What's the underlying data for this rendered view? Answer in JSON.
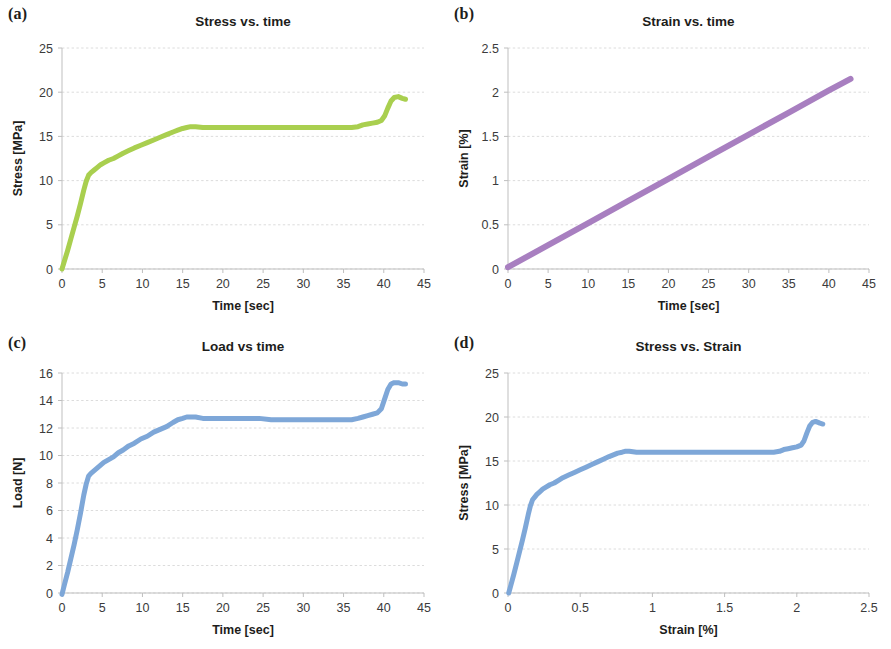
{
  "figure": {
    "background": "#ffffff",
    "panel_labels": [
      "(a)",
      "(b)",
      "(c)",
      "(d)"
    ]
  },
  "colors": {
    "green": "#a9cf4f",
    "purple": "#a87fc0",
    "blue": "#7ea7d8",
    "gridline": "#d8d8d8",
    "axis": "#bfbfbf",
    "text": "#1d1d1b"
  },
  "chart_data": [
    {
      "panel": "(a)",
      "type": "line",
      "title": "Stress vs. time",
      "xlabel": "Time [sec]",
      "ylabel": "Stress [MPa]",
      "xlim": [
        0,
        45
      ],
      "ylim": [
        0,
        25
      ],
      "xticks": [
        0,
        5,
        10,
        15,
        20,
        25,
        30,
        35,
        40,
        45
      ],
      "xtick_labels": [
        "0",
        "5",
        "10",
        "15",
        "20",
        "25",
        "30",
        "35",
        "40",
        "45"
      ],
      "yticks": [
        0,
        5,
        10,
        15,
        20,
        25
      ],
      "ytick_labels": [
        "0",
        "5",
        "10",
        "15",
        "20",
        "25"
      ],
      "grid": true,
      "legend": "none",
      "color": "#a9cf4f",
      "linewidth": 5,
      "series": [
        {
          "name": "Stress",
          "x": [
            0.0,
            0.3,
            0.7,
            1.1,
            1.5,
            1.9,
            2.3,
            2.7,
            3.0,
            3.3,
            3.6,
            4.0,
            4.4,
            4.8,
            5.2,
            5.8,
            6.4,
            7.0,
            7.6,
            8.3,
            9.0,
            9.8,
            10.6,
            11.4,
            12.2,
            13.0,
            13.8,
            14.4,
            15.0,
            15.5,
            16.0,
            16.6,
            17.5,
            18.5,
            20.0,
            21.5,
            23.0,
            24.5,
            26.0,
            27.5,
            29.0,
            30.5,
            32.0,
            33.5,
            35.0,
            36.0,
            36.8,
            37.4,
            38.0,
            38.6,
            39.2,
            39.7,
            40.1,
            40.5,
            40.9,
            41.3,
            41.8,
            42.3,
            42.7
          ],
          "y": [
            0.0,
            0.9,
            2.1,
            3.4,
            4.7,
            6.0,
            7.4,
            8.9,
            9.9,
            10.6,
            10.9,
            11.2,
            11.5,
            11.8,
            12.0,
            12.3,
            12.5,
            12.8,
            13.1,
            13.4,
            13.7,
            14.0,
            14.3,
            14.6,
            14.9,
            15.2,
            15.5,
            15.7,
            15.9,
            16.0,
            16.1,
            16.1,
            16.0,
            16.0,
            16.0,
            16.0,
            16.0,
            16.0,
            16.0,
            16.0,
            16.0,
            16.0,
            16.0,
            16.0,
            16.0,
            16.0,
            16.1,
            16.3,
            16.4,
            16.5,
            16.6,
            16.8,
            17.3,
            18.2,
            19.0,
            19.4,
            19.5,
            19.3,
            19.2
          ]
        }
      ]
    },
    {
      "panel": "(b)",
      "type": "line",
      "title": "Strain vs. time",
      "xlabel": "Time [sec]",
      "ylabel": "Strain [%]",
      "xlim": [
        0,
        45
      ],
      "ylim": [
        0,
        2.5
      ],
      "xticks": [
        0,
        5,
        10,
        15,
        20,
        25,
        30,
        35,
        40,
        45
      ],
      "xtick_labels": [
        "0",
        "5",
        "10",
        "15",
        "20",
        "25",
        "30",
        "35",
        "40",
        "45"
      ],
      "yticks": [
        0,
        0.5,
        1,
        1.5,
        2,
        2.5
      ],
      "ytick_labels": [
        "0",
        "0.5",
        "1",
        "1.5",
        "2",
        "2.5"
      ],
      "grid": true,
      "legend": "none",
      "color": "#a87fc0",
      "linewidth": 6,
      "series": [
        {
          "name": "Strain",
          "x": [
            0.0,
            5.0,
            10.0,
            15.0,
            20.0,
            25.0,
            30.0,
            35.0,
            40.0,
            42.7
          ],
          "y": [
            0.02,
            0.27,
            0.52,
            0.77,
            1.02,
            1.27,
            1.52,
            1.77,
            2.02,
            2.15
          ]
        }
      ]
    },
    {
      "panel": "(c)",
      "type": "line",
      "title": "Load vs time",
      "xlabel": "Time [sec]",
      "ylabel": "Load [N]",
      "xlim": [
        0,
        45
      ],
      "ylim": [
        0,
        16
      ],
      "xticks": [
        0,
        5,
        10,
        15,
        20,
        25,
        30,
        35,
        40,
        45
      ],
      "xtick_labels": [
        "0",
        "5",
        "10",
        "15",
        "20",
        "25",
        "30",
        "35",
        "40",
        "45"
      ],
      "yticks": [
        0,
        2,
        4,
        6,
        8,
        10,
        12,
        14,
        16
      ],
      "ytick_labels": [
        "0",
        "2",
        "4",
        "6",
        "8",
        "10",
        "12",
        "14",
        "16"
      ],
      "grid": true,
      "legend": "none",
      "color": "#7ea7d8",
      "linewidth": 5,
      "series": [
        {
          "name": "Load",
          "x": [
            0.0,
            0.3,
            0.7,
            1.1,
            1.5,
            1.9,
            2.3,
            2.7,
            3.0,
            3.3,
            3.6,
            4.0,
            4.4,
            4.8,
            5.2,
            5.8,
            6.4,
            7.0,
            7.6,
            8.3,
            9.0,
            9.8,
            10.6,
            11.4,
            12.2,
            13.0,
            13.8,
            14.4,
            15.0,
            15.5,
            16.0,
            16.6,
            17.5,
            18.5,
            20.0,
            21.5,
            23.0,
            24.5,
            26.0,
            27.5,
            29.0,
            30.5,
            32.0,
            33.5,
            35.0,
            36.0,
            36.8,
            37.4,
            38.0,
            38.6,
            39.2,
            39.7,
            40.1,
            40.5,
            40.9,
            41.3,
            41.8,
            42.3,
            42.7
          ],
          "y": [
            -0.1,
            0.6,
            1.5,
            2.5,
            3.5,
            4.6,
            5.8,
            7.1,
            7.9,
            8.5,
            8.7,
            8.9,
            9.1,
            9.3,
            9.5,
            9.7,
            9.9,
            10.2,
            10.4,
            10.7,
            10.9,
            11.2,
            11.4,
            11.7,
            11.9,
            12.1,
            12.4,
            12.6,
            12.7,
            12.8,
            12.8,
            12.8,
            12.7,
            12.7,
            12.7,
            12.7,
            12.7,
            12.7,
            12.6,
            12.6,
            12.6,
            12.6,
            12.6,
            12.6,
            12.6,
            12.6,
            12.7,
            12.8,
            12.9,
            13.0,
            13.1,
            13.4,
            14.1,
            14.8,
            15.2,
            15.3,
            15.3,
            15.2,
            15.2
          ]
        }
      ]
    },
    {
      "panel": "(d)",
      "type": "line",
      "title": "Stress vs. Strain",
      "xlabel": "Strain [%]",
      "ylabel": "Stress [MPa]",
      "xlim": [
        0,
        2.5
      ],
      "ylim": [
        0,
        25
      ],
      "xticks": [
        0,
        0.5,
        1,
        1.5,
        2,
        2.5
      ],
      "xtick_labels": [
        "0",
        "0.5",
        "1",
        "1.5",
        "2",
        "2.5"
      ],
      "yticks": [
        0,
        5,
        10,
        15,
        20,
        25
      ],
      "ytick_labels": [
        "0",
        "5",
        "10",
        "15",
        "20",
        "25"
      ],
      "grid": true,
      "legend": "none",
      "color": "#7ea7d8",
      "linewidth": 5,
      "series": [
        {
          "name": "Stress",
          "x": [
            0.005,
            0.02,
            0.04,
            0.06,
            0.08,
            0.1,
            0.12,
            0.14,
            0.155,
            0.17,
            0.185,
            0.2,
            0.22,
            0.24,
            0.26,
            0.29,
            0.32,
            0.35,
            0.38,
            0.42,
            0.46,
            0.5,
            0.54,
            0.58,
            0.62,
            0.66,
            0.7,
            0.73,
            0.76,
            0.79,
            0.81,
            0.84,
            0.89,
            0.94,
            1.02,
            1.1,
            1.17,
            1.25,
            1.33,
            1.41,
            1.48,
            1.56,
            1.64,
            1.72,
            1.79,
            1.84,
            1.88,
            1.91,
            1.94,
            1.97,
            2.0,
            2.03,
            2.05,
            2.07,
            2.09,
            2.11,
            2.13,
            2.16,
            2.18
          ],
          "y": [
            0.0,
            0.9,
            2.1,
            3.4,
            4.7,
            6.0,
            7.4,
            8.9,
            9.9,
            10.6,
            10.9,
            11.2,
            11.5,
            11.8,
            12.0,
            12.3,
            12.5,
            12.8,
            13.1,
            13.4,
            13.7,
            14.0,
            14.3,
            14.6,
            14.9,
            15.2,
            15.5,
            15.7,
            15.9,
            16.0,
            16.1,
            16.1,
            16.0,
            16.0,
            16.0,
            16.0,
            16.0,
            16.0,
            16.0,
            16.0,
            16.0,
            16.0,
            16.0,
            16.0,
            16.0,
            16.0,
            16.1,
            16.3,
            16.4,
            16.5,
            16.6,
            16.8,
            17.3,
            18.2,
            19.0,
            19.4,
            19.5,
            19.3,
            19.2
          ]
        }
      ]
    }
  ]
}
